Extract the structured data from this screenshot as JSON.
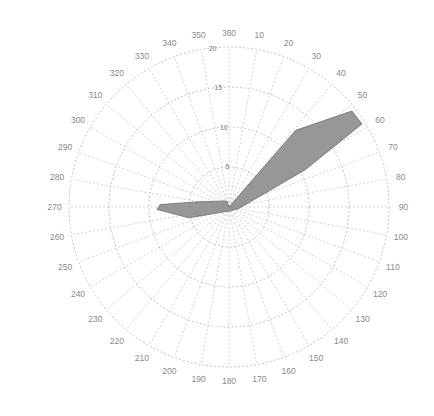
{
  "chart_data": {
    "type": "polar",
    "title": "",
    "theta_unit": "degrees",
    "theta_direction": "clockwise",
    "theta_zero": "top",
    "theta_ticks": [
      0,
      10,
      20,
      30,
      40,
      50,
      60,
      70,
      80,
      90,
      100,
      110,
      120,
      130,
      140,
      150,
      160,
      170,
      180,
      190,
      200,
      210,
      220,
      230,
      240,
      250,
      260,
      270,
      280,
      290,
      300,
      310,
      320,
      330,
      340,
      350
    ],
    "theta_tick_labels": [
      "360",
      "10",
      "20",
      "30",
      "40",
      "50",
      "60",
      "70",
      "80",
      "90",
      "100",
      "110",
      "120",
      "130",
      "140",
      "150",
      "160",
      "170",
      "180",
      "190",
      "200",
      "210",
      "220",
      "230",
      "240",
      "250",
      "260",
      "270",
      "280",
      "290",
      "300",
      "310",
      "320",
      "330",
      "340",
      "350"
    ],
    "r_ticks": [
      5,
      10,
      15,
      20
    ],
    "r_tick_labels": [
      "5",
      "10",
      "15",
      "20"
    ],
    "r_max": 20,
    "grid": true,
    "fill_color": "#8c8c8c",
    "series": [
      {
        "name": "polar-patch",
        "points": [
          {
            "theta": 0,
            "r": 0
          },
          {
            "theta": 41,
            "r": 12.7
          },
          {
            "theta": 52,
            "r": 19.5
          },
          {
            "theta": 58,
            "r": 19.6
          },
          {
            "theta": 64,
            "r": 10.6
          },
          {
            "theta": 100,
            "r": 1.2
          },
          {
            "theta": 180,
            "r": 0.5
          },
          {
            "theta": 255,
            "r": 5.2
          },
          {
            "theta": 268,
            "r": 9.0
          },
          {
            "theta": 272,
            "r": 8.6
          },
          {
            "theta": 280,
            "r": 3.8
          },
          {
            "theta": 340,
            "r": 0.8
          }
        ]
      }
    ]
  }
}
